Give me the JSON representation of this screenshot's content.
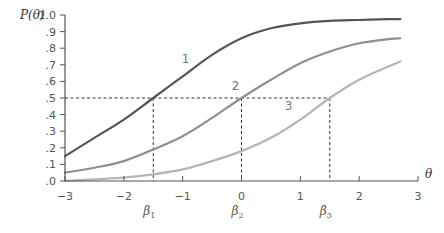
{
  "chart_data": {
    "type": "line",
    "title": "",
    "ylabel": "P(θ)",
    "xlabel": "θ",
    "xlim": [
      -3,
      3
    ],
    "ylim": [
      0,
      1.0
    ],
    "grid": false,
    "x_ticks": [
      "−3",
      "−2",
      "−1",
      "0",
      "1",
      "2",
      "3"
    ],
    "y_ticks": [
      ".0",
      ".1",
      ".2",
      ".3",
      ".4",
      ".5",
      ".6",
      ".7",
      ".8",
      ".9",
      "1.0"
    ],
    "series": [
      {
        "name": "1",
        "color": "#555555",
        "x": [
          -3,
          -2.5,
          -2,
          -1.5,
          -1,
          -0.5,
          0,
          0.5,
          1,
          1.5,
          2,
          2.5,
          2.7
        ],
        "values": [
          0.15,
          0.26,
          0.37,
          0.5,
          0.63,
          0.76,
          0.86,
          0.92,
          0.95,
          0.965,
          0.97,
          0.975,
          0.975
        ]
      },
      {
        "name": "2",
        "color": "#8f8f8f",
        "x": [
          -3,
          -2.5,
          -2,
          -1.5,
          -1,
          -0.5,
          0,
          0.5,
          1,
          1.5,
          2,
          2.5,
          2.7
        ],
        "values": [
          0.05,
          0.08,
          0.12,
          0.19,
          0.27,
          0.38,
          0.5,
          0.61,
          0.71,
          0.78,
          0.83,
          0.855,
          0.86
        ]
      },
      {
        "name": "3",
        "color": "#b5b5b5",
        "x": [
          -3,
          -2.5,
          -2,
          -1.5,
          -1,
          -0.5,
          0,
          0.5,
          1,
          1.5,
          2,
          2.5,
          2.7
        ],
        "values": [
          0.0,
          0.01,
          0.02,
          0.04,
          0.07,
          0.12,
          0.18,
          0.26,
          0.37,
          0.5,
          0.61,
          0.69,
          0.72
        ]
      }
    ],
    "reference_lines": {
      "horizontal": {
        "y": 0.5,
        "style": "dashed",
        "x_end": 1.5
      },
      "vertical": [
        {
          "x": -1.5,
          "label": "β1",
          "label_text": "β",
          "label_sub": "1"
        },
        {
          "x": 0,
          "label": "β2",
          "label_text": "β",
          "label_sub": "2"
        },
        {
          "x": 1.5,
          "label": "β3",
          "label_text": "β",
          "label_sub": "3"
        }
      ]
    },
    "annotations": [
      {
        "text": "1",
        "x": -0.95,
        "y": 0.71
      },
      {
        "text": "2",
        "x": -0.1,
        "y": 0.55
      },
      {
        "text": "3",
        "x": 0.8,
        "y": 0.43
      }
    ]
  }
}
